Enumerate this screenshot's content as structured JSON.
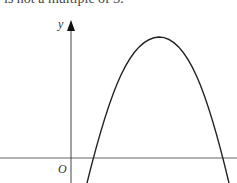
{
  "caption": "is not a multiple of 3.",
  "diagram": {
    "type": "graph-sketch",
    "axes": {
      "y_label": "y",
      "origin_label": "O"
    },
    "curve": {
      "shape": "inverted-parabola",
      "roots": "two positive x-intercepts",
      "maximum": "single turning point in first quadrant"
    },
    "colors": {
      "axis": "#555555",
      "curve": "#222222",
      "text": "#333333"
    }
  }
}
